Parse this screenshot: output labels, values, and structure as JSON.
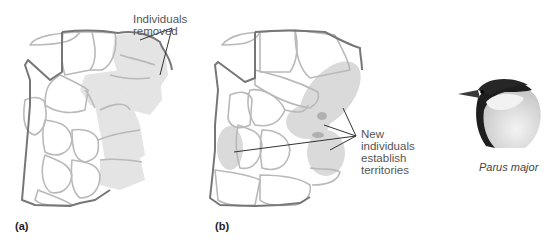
{
  "figure": {
    "panels": [
      {
        "id": "a",
        "letter": "(a)",
        "annotation": "Individuals removed"
      },
      {
        "id": "b",
        "letter": "(b)",
        "annotation_lines": [
          "New individuals",
          "establish",
          "territories"
        ]
      }
    ],
    "species": {
      "name": "Parus major"
    },
    "colors": {
      "territory_outline": "#b8b8b8",
      "boundary_outline": "#707070",
      "removed_fill": "#e3e3e3",
      "new_fill": "#d9d9d9",
      "overlap_fill": "#b0b0b0",
      "leader_line": "#333333"
    }
  }
}
